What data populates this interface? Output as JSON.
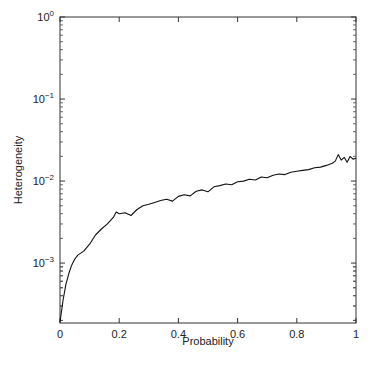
{
  "chart_data": {
    "type": "line",
    "title": "",
    "xlabel": "Probability",
    "ylabel": "Heterogeneity",
    "xscale": "linear",
    "yscale": "log",
    "xlim": [
      0,
      1
    ],
    "ylim": [
      0.000186,
      1
    ],
    "grid": false,
    "legend": null,
    "x_ticks": [
      0,
      0.2,
      0.4,
      0.6,
      0.8,
      1
    ],
    "x_tick_labels": [
      "0",
      "0.2",
      "0.4",
      "0.6",
      "0.8",
      "1"
    ],
    "y_ticks": [
      1,
      0.1,
      0.01,
      0.001
    ],
    "y_tick_labels": [
      {
        "base": "10",
        "exp": "0"
      },
      {
        "base": "10",
        "exp": "−1"
      },
      {
        "base": "10",
        "exp": "−2"
      },
      {
        "base": "10",
        "exp": "−3"
      }
    ],
    "series": [
      {
        "name": "Heterogeneity",
        "color": "#111111",
        "x": [
          0,
          0.01,
          0.02,
          0.03,
          0.04,
          0.05,
          0.06,
          0.08,
          0.1,
          0.12,
          0.14,
          0.16,
          0.18,
          0.19,
          0.2,
          0.22,
          0.24,
          0.26,
          0.28,
          0.3,
          0.32,
          0.34,
          0.36,
          0.38,
          0.4,
          0.42,
          0.44,
          0.46,
          0.48,
          0.5,
          0.52,
          0.54,
          0.56,
          0.58,
          0.6,
          0.62,
          0.64,
          0.66,
          0.68,
          0.7,
          0.72,
          0.74,
          0.76,
          0.78,
          0.8,
          0.82,
          0.84,
          0.86,
          0.88,
          0.9,
          0.92,
          0.93,
          0.94,
          0.95,
          0.96,
          0.97,
          0.98,
          0.99,
          1.0
        ],
        "y": [
          0.00019,
          0.00035,
          0.00055,
          0.00075,
          0.00095,
          0.00112,
          0.00125,
          0.0014,
          0.0017,
          0.0022,
          0.0026,
          0.003,
          0.0036,
          0.0042,
          0.004,
          0.0041,
          0.0038,
          0.0045,
          0.005,
          0.0052,
          0.0055,
          0.0058,
          0.006,
          0.0057,
          0.0065,
          0.0068,
          0.0066,
          0.0075,
          0.0078,
          0.0074,
          0.0085,
          0.0088,
          0.0092,
          0.009,
          0.0098,
          0.01,
          0.0105,
          0.0103,
          0.0112,
          0.011,
          0.0118,
          0.0122,
          0.012,
          0.0128,
          0.0132,
          0.0135,
          0.0138,
          0.0145,
          0.0148,
          0.0155,
          0.0165,
          0.0175,
          0.021,
          0.018,
          0.0195,
          0.017,
          0.02,
          0.0185,
          0.019
        ]
      }
    ]
  }
}
